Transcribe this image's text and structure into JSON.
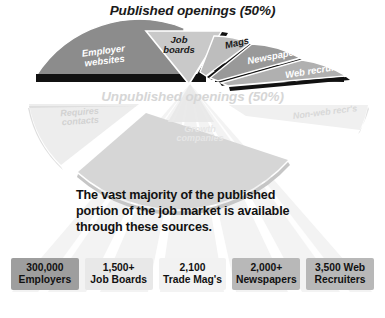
{
  "headings": {
    "published": "Published openings (50%)",
    "unpublished": "Unpublished openings (50%)"
  },
  "statement": "The vast majority of the published portion of the job market is available through these sources.",
  "published_segments": [
    {
      "id": "employer-websites",
      "label": "Employer\nwebsites",
      "fill": "#8c8c8c",
      "text_color": "#ffffff"
    },
    {
      "id": "job-boards",
      "label": "Job\nboards",
      "fill": "#c9c9c9",
      "text_color": "#1a1a1a"
    },
    {
      "id": "mags",
      "label": "Mags",
      "fill": "#bdbdbd",
      "text_color": "#1a1a1a"
    },
    {
      "id": "newspapers",
      "label": "Newspapers",
      "fill": "#999999",
      "text_color": "#ffffff"
    },
    {
      "id": "web-recruiters",
      "label": "Web recruiters",
      "fill": "#b0b0b0",
      "text_color": "#ffffff"
    }
  ],
  "unpublished_segments": [
    {
      "id": "requires-contacts",
      "label": "Requires\ncontacts",
      "fill": "#e3e3e3",
      "text_color": "#d2d2d2"
    },
    {
      "id": "growth-companies",
      "label": "Growth\ncompanies",
      "fill": "#d2d2d2",
      "text_color": "#e6e6e6"
    },
    {
      "id": "non-web-recruiters",
      "label": "Non-web recr's",
      "fill": "#ebebeb",
      "text_color": "#d8d8d8"
    }
  ],
  "source_boxes": [
    {
      "id": "employers",
      "number": "300,000",
      "title": "Employers",
      "fill": "#9e9e9e"
    },
    {
      "id": "job-boards",
      "number": "1,500+",
      "title": "Job Boards",
      "fill": "#e8e8e8"
    },
    {
      "id": "trade-mags",
      "number": "2,100",
      "title": "Trade Mag's",
      "fill": "#f2f2f2"
    },
    {
      "id": "newspapers",
      "number": "2,000+",
      "title": "Newspapers",
      "fill": "#b8b8b8"
    },
    {
      "id": "web-recruiters",
      "number": "3,500 Web",
      "title": "Recruiters",
      "fill": "#b8b8b8"
    }
  ],
  "colors": {
    "background": "#ffffff",
    "heading_dark": "#1a1a1a",
    "heading_light": "#d6d6d6",
    "shadow": "#111111",
    "ray_light": "#f2f2f2",
    "ray_edge": "#ffffff"
  }
}
